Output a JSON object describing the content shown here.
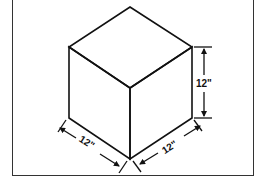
{
  "diagram": {
    "type": "isometric-cube",
    "colors": {
      "stroke": "#111111",
      "frame": "#333333",
      "background": "#ffffff"
    },
    "dimensions": {
      "height_label": "12\"",
      "left_depth_label": "12\"",
      "right_width_label": "12\""
    }
  }
}
